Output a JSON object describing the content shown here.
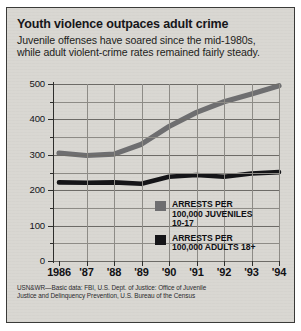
{
  "headline": "Youth violence outpaces adult crime",
  "deck": [
    "Juvenile offenses have soared since the mid-1980s,",
    "while adult violent-crime rates remained fairly steady."
  ],
  "legend": {
    "items": [
      {
        "swatch_color": "#6e6e70",
        "lines": [
          "ARRESTS PER",
          "100,000 JUVENILES",
          "10-17"
        ]
      },
      {
        "swatch_color": "#151518",
        "lines": [
          "ARRESTS PER",
          "100,000 ADULTS 18+"
        ]
      }
    ]
  },
  "source": [
    "USN&WR—Basic data: FBI, U.S. Dept. of Justice: Office of Juvenile",
    "Justice and Delinquency Prevention, U.S. Bureau of the Census"
  ],
  "chart_data": {
    "type": "line",
    "title": "Youth violence outpaces adult crime",
    "subtitle": "Juvenile offenses have soared since the mid-1980s, while adult violent-crime rates remained fairly steady.",
    "xlabel": "",
    "ylabel": "",
    "x": [
      1986,
      1987,
      1988,
      1989,
      1990,
      1991,
      1992,
      1993,
      1994
    ],
    "categories": [
      "1986",
      "'87",
      "'88",
      "'89",
      "'90",
      "'91",
      "'92",
      "'93",
      "'94"
    ],
    "series": [
      {
        "name": "ARRESTS PER 100,000 JUVENILES 10-17",
        "color": "#6e6e70",
        "values": [
          305,
          298,
          302,
          330,
          380,
          420,
          450,
          472,
          495
        ]
      },
      {
        "name": "ARRESTS PER 100,000 ADULTS 18+",
        "color": "#151518",
        "values": [
          222,
          221,
          222,
          218,
          238,
          243,
          238,
          247,
          251
        ]
      }
    ],
    "ylim": [
      0,
      500
    ],
    "yticks": [
      0,
      100,
      200,
      300,
      400,
      500
    ],
    "yticklabels": [
      "0",
      "100",
      "200",
      "300",
      "400",
      "500"
    ],
    "yminor_ticks": [
      50,
      150,
      250,
      350,
      450
    ],
    "xlim": [
      1986,
      1994
    ],
    "grid": true,
    "legend_position": "inside-lower-right"
  }
}
